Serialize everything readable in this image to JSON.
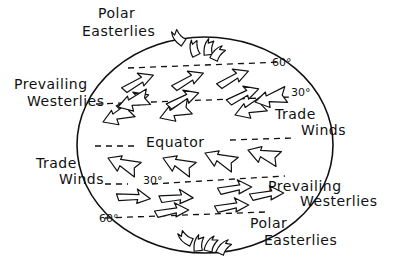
{
  "diagram": {
    "labels": {
      "polar_easterlies_north_line1": "Polar",
      "polar_easterlies_north_line2": "Easterlies",
      "prevailing_westerlies_north_line1": "Prevailing",
      "prevailing_westerlies_north_line2": "Westerlies",
      "trade_winds_north_line1": "Trade",
      "trade_winds_north_line2": "Winds",
      "equator": "Equator",
      "trade_winds_south_line1": "Trade",
      "trade_winds_south_line2": "Winds",
      "prevailing_westerlies_south_line1": "Prevailing",
      "prevailing_westerlies_south_line2": "Westerlies",
      "polar_easterlies_south_line1": "Polar",
      "polar_easterlies_south_line2": "Easterlies"
    },
    "latitudes": {
      "north_60": "60°",
      "north_30": "30°",
      "south_30": "30°",
      "south_60": "60°"
    },
    "colors": {
      "ink": "#111111",
      "background": "#ffffff"
    }
  }
}
